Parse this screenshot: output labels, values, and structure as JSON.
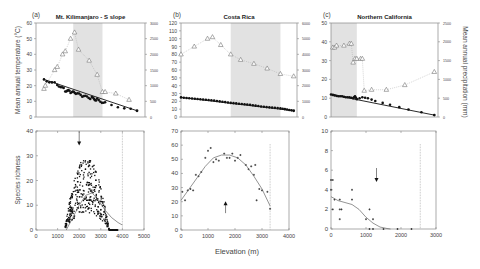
{
  "figure": {
    "xlabel": "Elevation (m)",
    "left_ylabel_top": "Mean annual temperature (°C)",
    "right_ylabel_top": "Mean annual precipitation (mm)",
    "ylabel_bottom": "Species richness"
  },
  "panels": [
    {
      "letter": "(a)",
      "title": "Mt. Kilimanjaro - S slope"
    },
    {
      "letter": "(b)",
      "title": "Costa Rica"
    },
    {
      "letter": "(c)",
      "title": "Northern California"
    }
  ],
  "chart_data": [
    {
      "type": "scatter",
      "panel": "(a) top",
      "title": "Mt. Kilimanjaro - S slope",
      "ylabel": "Mean annual temperature (°C)",
      "y2label": "Mean annual precipitation (mm)",
      "ylim": [
        0,
        60
      ],
      "yticks": [
        0,
        10,
        20,
        30,
        40,
        50,
        60
      ],
      "y2lim": [
        0,
        3000
      ],
      "y2ticks": [
        0,
        500,
        1000,
        1500,
        2000,
        2500,
        3000
      ],
      "xlim": [
        0,
        5000
      ],
      "shaded_band_x": [
        2100,
        3200
      ],
      "series": [
        {
          "name": "Temperature (filled circles)",
          "axis": "left",
          "x": [
            1000,
            1500,
            1800,
            2000,
            2200,
            2500,
            2800,
            3000,
            3300,
            4500
          ],
          "y": [
            24,
            21,
            17,
            16,
            15,
            13,
            12,
            11,
            9,
            4
          ]
        },
        {
          "name": "Precipitation (open triangles)",
          "axis": "right",
          "x": [
            1000,
            1050,
            1400,
            1500,
            1700,
            1800,
            2000,
            2150,
            2300,
            2700,
            3000,
            3200,
            3300,
            3700,
            4200
          ],
          "y": [
            900,
            1000,
            1500,
            1600,
            2000,
            2100,
            2500,
            2700,
            2150,
            1800,
            1350,
            800,
            800,
            750,
            550
          ]
        }
      ]
    },
    {
      "type": "scatter",
      "panel": "(b) top",
      "title": "Costa Rica",
      "ylim": [
        0,
        120
      ],
      "yticks": [
        0,
        10,
        20,
        30,
        40,
        50,
        60,
        70,
        80,
        90,
        100,
        110,
        120
      ],
      "y2lim": [
        0,
        6000
      ],
      "y2ticks": [
        0,
        1000,
        2000,
        3000,
        4000,
        5000,
        6000
      ],
      "xlim": [
        0,
        4000
      ],
      "shaded_band_x": [
        1500,
        3000
      ],
      "series": [
        {
          "name": "Temperature (filled circles)",
          "axis": "left",
          "x": [
            0,
            500,
            1000,
            1500,
            2000,
            2500,
            3000,
            3400
          ],
          "y": [
            25,
            23,
            21,
            18,
            16,
            13,
            11,
            8
          ]
        },
        {
          "name": "Precipitation (open triangles)",
          "axis": "right",
          "x": [
            0,
            400,
            800,
            950,
            1200,
            1500,
            1800,
            2200,
            2600,
            3000,
            3400
          ],
          "y": [
            4000,
            4500,
            5000,
            5100,
            4600,
            4000,
            3650,
            3400,
            3100,
            2750,
            2600
          ]
        }
      ]
    },
    {
      "type": "scatter",
      "panel": "(c) top",
      "title": "Northern California",
      "ylim": [
        0,
        50
      ],
      "yticks": [
        0,
        10,
        20,
        30,
        40,
        50
      ],
      "y2lim": [
        0,
        2500
      ],
      "y2ticks": [
        0,
        500,
        1000,
        1500,
        2000,
        2500
      ],
      "xlim": [
        0,
        3000
      ],
      "shaded_band_x": [
        0,
        700
      ],
      "series": [
        {
          "name": "Temperature (filled circles)",
          "axis": "left",
          "x": [
            0,
            100,
            200,
            300,
            400,
            500,
            600,
            650,
            700,
            850,
            1000,
            1200,
            1600,
            2100,
            2800
          ],
          "y": [
            12,
            11.5,
            11,
            11,
            10.5,
            10.5,
            10,
            11,
            9.5,
            10.5,
            10,
            8.5,
            6.5,
            4,
            1
          ]
        },
        {
          "name": "Precipitation (open triangles)",
          "axis": "right",
          "x": [
            50,
            100,
            150,
            350,
            500,
            550,
            600,
            650,
            700,
            800,
            850,
            900,
            1100,
            1500,
            2000,
            2800
          ],
          "y": [
            1850,
            1850,
            1900,
            1900,
            1950,
            1950,
            1450,
            1550,
            1550,
            1550,
            1550,
            700,
            725,
            725,
            850,
            1200
          ]
        }
      ]
    },
    {
      "type": "scatter",
      "panel": "(a) bottom",
      "ylabel": "Species richness",
      "xlim": [
        0,
        5000
      ],
      "xticks": [
        0,
        1000,
        2000,
        3000,
        4000,
        5000
      ],
      "ylim": [
        0,
        40
      ],
      "yticks": [
        0,
        10,
        20,
        30,
        40
      ],
      "arrow_x": 2000,
      "arrow_y": 35,
      "dotted_line_x": 4000,
      "fit_curve": {
        "x": [
          1400,
          1700,
          2000,
          2300,
          2600,
          2900,
          3200,
          3500,
          3800,
          4000
        ],
        "y": [
          0,
          5,
          10,
          14,
          15,
          12,
          8,
          5,
          3,
          2
        ]
      },
      "points_summary": "dense cloud of several hundred points between 1300 and 3800 m, peak richness ~28 near 2100-2400 m"
    },
    {
      "type": "scatter",
      "panel": "(b) bottom",
      "xlim": [
        0,
        4000
      ],
      "xticks": [
        0,
        1000,
        2000,
        3000,
        4000
      ],
      "ylim": [
        0,
        70
      ],
      "yticks": [
        0,
        10,
        20,
        30,
        40,
        50,
        60,
        70
      ],
      "arrow_x": 1650,
      "arrow_y": 19,
      "dotted_line_x": 3300,
      "fit_curve": {
        "x": [
          0,
          300,
          600,
          900,
          1200,
          1500,
          1800,
          2100,
          2400,
          2700,
          3000,
          3300
        ],
        "y": [
          21,
          29,
          37,
          45,
          51,
          53,
          53,
          51,
          46,
          38,
          29,
          17
        ]
      },
      "points": {
        "x": [
          50,
          150,
          250,
          350,
          450,
          550,
          650,
          750,
          900,
          1000,
          1100,
          1200,
          1300,
          1400,
          1600,
          1700,
          1800,
          1900,
          2000,
          2100,
          2200,
          2400,
          2500,
          2600,
          2700,
          2750,
          2800,
          2900,
          3000,
          3200,
          3300
        ],
        "y": [
          27,
          21,
          28,
          29,
          28,
          39,
          38,
          41,
          51,
          56,
          58,
          48,
          50,
          49,
          54,
          51,
          51,
          54,
          49,
          51,
          53,
          46,
          43,
          45,
          39,
          46,
          21,
          29,
          28,
          27,
          15
        ]
      }
    },
    {
      "type": "scatter",
      "panel": "(c) bottom",
      "xlim": [
        0,
        3000
      ],
      "xticks": [
        0,
        1000,
        2000,
        3000
      ],
      "ylim": [
        0,
        10
      ],
      "yticks": [
        0,
        2,
        4,
        6,
        8,
        10
      ],
      "arrow_x": 1300,
      "arrow_y": 5,
      "dotted_line_x": 2550,
      "fit_curve": {
        "x": [
          0,
          200,
          400,
          600,
          800,
          1000,
          1200,
          1400,
          1600,
          1700
        ],
        "y": [
          3.3,
          2.9,
          2.7,
          2.5,
          2.0,
          1.2,
          0.6,
          0.2,
          0.05,
          0
        ]
      },
      "points": {
        "x": [
          0,
          50,
          0,
          100,
          50,
          250,
          250,
          300,
          250,
          600,
          600,
          1000,
          1100,
          1200,
          1100,
          1200,
          1500,
          1900,
          2300
        ],
        "y": [
          5,
          5,
          4,
          3,
          2,
          3,
          2,
          2,
          1,
          4,
          3,
          1,
          2,
          1,
          0,
          0,
          0,
          0,
          0
        ]
      }
    }
  ]
}
